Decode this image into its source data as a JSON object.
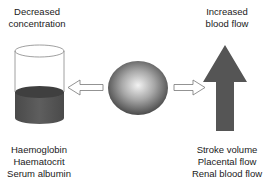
{
  "diagram": {
    "left": {
      "heading": [
        "Decreased",
        "concentration"
      ],
      "items": [
        "Haemoglobin",
        "Haematocrit",
        "Serum albumin"
      ],
      "icon": "cylinder-half-filled"
    },
    "right": {
      "heading": [
        "Increased",
        "blood flow"
      ],
      "items": [
        "Stroke volume",
        "Placental flow",
        "Renal blood flow"
      ],
      "icon": "up-arrow"
    },
    "center": {
      "icon": "shaded-sphere"
    },
    "connectors": [
      {
        "from": "center",
        "to": "left",
        "style": "hollow-arrow"
      },
      {
        "from": "center",
        "to": "right",
        "style": "hollow-arrow"
      }
    ],
    "colors": {
      "fill_dark": "#555555",
      "outline": "#777777",
      "sphere_light": "#f2f2f2",
      "sphere_dark": "#3a3a3a",
      "text": "#1a1a1a"
    }
  }
}
